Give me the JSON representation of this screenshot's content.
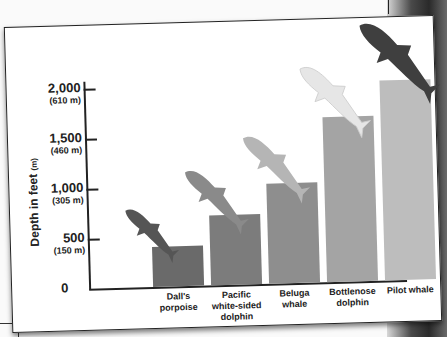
{
  "chart_data": {
    "type": "bar",
    "title": "",
    "xlabel": "",
    "ylabel": "Depth in feet",
    "ylabel_unit_note": "(m)",
    "ylim": [
      0,
      2200
    ],
    "yticks": [
      {
        "value": 0,
        "label": "0",
        "metric": ""
      },
      {
        "value": 500,
        "label": "500",
        "metric": "(150 m)"
      },
      {
        "value": 1000,
        "label": "1,000",
        "metric": "(305 m)"
      },
      {
        "value": 1500,
        "label": "1,500",
        "metric": "(460 m)"
      },
      {
        "value": 2000,
        "label": "2,000",
        "metric": "(610 m)"
      }
    ],
    "grid": false,
    "legend": null,
    "categories": [
      "Dall's porpoise",
      "Pacific white-sided dolphin",
      "Beluga whale",
      "Bottlenose dolphin",
      "Pilot whale"
    ],
    "category_lines": [
      [
        "Dall's",
        "porpoise"
      ],
      [
        "Pacific",
        "white-sided",
        "dolphin"
      ],
      [
        "Beluga",
        "whale"
      ],
      [
        "Bottlenose",
        "dolphin"
      ],
      [
        "Pilot whale"
      ]
    ],
    "values": [
      400,
      700,
      1000,
      1650,
      2000
    ],
    "bar_colors": [
      "#6a6a6a",
      "#7c7c7c",
      "#8e8e8e",
      "#a4a4a4",
      "#bdbdbd"
    ],
    "animal_colors": [
      "#555555",
      "#8a8a8a",
      "#b5b5b5",
      "#e6e6e6",
      "#3f3f3f"
    ],
    "annotations": "Silhouette of each animal diving, drawn above its bar"
  },
  "axis": {
    "ylabel_main": "Depth in feet ",
    "ylabel_unit": "(m)"
  }
}
